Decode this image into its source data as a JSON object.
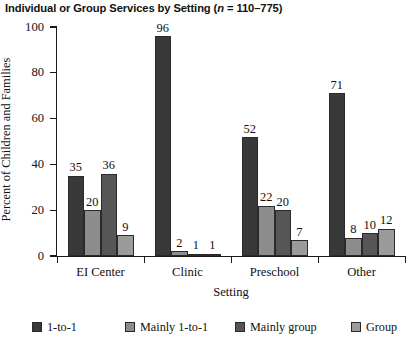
{
  "chart_data": {
    "type": "bar",
    "title": "Individual or Group Services by Setting (n = 110–775)",
    "title_prefix": "Individual or Group Services by Setting (",
    "title_italic": "n",
    "title_suffix": " = 110–775)",
    "xlabel": "Setting",
    "ylabel": "Percent of Children and Families",
    "categories": [
      "EI Center",
      "Clinic",
      "Preschool",
      "Other"
    ],
    "ylim": [
      0,
      100
    ],
    "yticks": [
      0,
      20,
      40,
      60,
      80,
      100
    ],
    "grid": false,
    "legend_position": "bottom",
    "series": [
      {
        "name": "1-to-1",
        "color": "#393939",
        "values": [
          35,
          96,
          52,
          71
        ]
      },
      {
        "name": "Mainly 1-to-1",
        "color": "#8d8d8d",
        "values": [
          20,
          2,
          22,
          8
        ]
      },
      {
        "name": "Mainly group",
        "color": "#565656",
        "values": [
          36,
          1,
          20,
          10
        ]
      },
      {
        "name": "Group",
        "color": "#9b9b9b",
        "values": [
          9,
          1,
          7,
          12
        ]
      }
    ]
  }
}
